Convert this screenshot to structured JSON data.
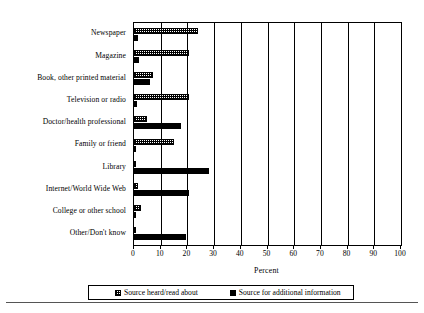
{
  "chart_data": {
    "type": "bar",
    "orientation": "horizontal",
    "title": "",
    "xlabel": "Percent",
    "ylabel": "",
    "xlim": [
      0,
      100
    ],
    "xticks": [
      0,
      10,
      20,
      30,
      40,
      50,
      60,
      70,
      80,
      90,
      100
    ],
    "xtick_labels": [
      "0",
      "10",
      "20",
      "30",
      "40",
      "50",
      "60",
      "70",
      "80",
      "90",
      "100"
    ],
    "grid": true,
    "grid_axis": "x",
    "legend_position": "bottom",
    "categories": [
      "Newspaper",
      "Magazine",
      "Book, other printed material",
      "Television or radio",
      "Doctor/health professional",
      "Family or friend",
      "Library",
      "Internet/World Wide Web",
      "College or other school",
      "Other/Don't know"
    ],
    "series": [
      {
        "name": "Source heard/read about",
        "fill": "checkered",
        "color": "#000000",
        "values": [
          24.0,
          20.5,
          7.0,
          20.5,
          5.0,
          15.0,
          0.4,
          1.5,
          2.5,
          0.4
        ]
      },
      {
        "name": "Source for additional information",
        "fill": "solid",
        "color": "#000000",
        "values": [
          1.5,
          2.0,
          6.0,
          1.0,
          17.5,
          0.6,
          28.0,
          20.5,
          0.6,
          19.5
        ]
      }
    ]
  },
  "axis": {
    "x_title": "Percent"
  },
  "legend": {
    "entries": [
      {
        "label": "Source heard/read about"
      },
      {
        "label": "Source for additional information"
      }
    ]
  }
}
